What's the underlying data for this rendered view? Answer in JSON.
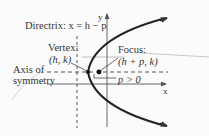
{
  "diagram": {
    "labels": {
      "directrix": "Directrix: x = h − p",
      "vertex_title": "Vertex:",
      "vertex_coords": "(h, k)",
      "focus_title": "Focus:",
      "focus_coords": "(h + p, k)",
      "axis_line1": "Axis of",
      "axis_line2": "symmetry",
      "p_condition": "p > 0",
      "x_axis": "x",
      "y_axis": "y"
    },
    "colors": {
      "curve": "#222222",
      "axes": "#555555",
      "dashed": "#444444",
      "text": "#333333",
      "background": "#fbfbfb"
    },
    "elements": {
      "vertex": {
        "x": 88,
        "y": 72
      },
      "focus": {
        "x": 99,
        "y": 72
      },
      "directrix_x": 77,
      "axis_of_symmetry_y": 72,
      "x_axis_y": 84,
      "y_axis_x": 107
    }
  }
}
